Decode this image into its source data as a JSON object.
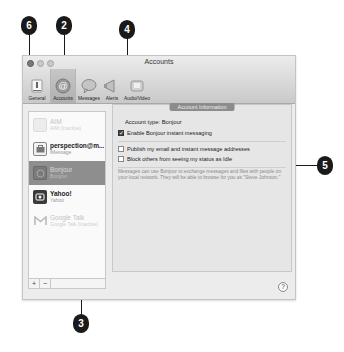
{
  "window": {
    "title": "Accounts",
    "toolbar": [
      {
        "label": "General",
        "icon": "general-switch-icon",
        "selected": false
      },
      {
        "label": "Accounts",
        "icon": "at-sign-icon",
        "selected": true
      },
      {
        "label": "Messages",
        "icon": "speech-bubble-icon",
        "selected": false
      },
      {
        "label": "Alerts",
        "icon": "megaphone-icon",
        "selected": false
      },
      {
        "label": "Audio/Video",
        "icon": "video-camera-icon",
        "selected": false
      }
    ]
  },
  "sidebar": {
    "accounts": [
      {
        "name": "AIM",
        "sub": "AIM (Inactive)",
        "icon": "aim-icon",
        "state": "dim"
      },
      {
        "name": "perspection@m...",
        "sub": "iMessage",
        "icon": "imessage-icon",
        "state": "normal"
      },
      {
        "name": "Bonjour",
        "sub": "Bonjour",
        "icon": "bonjour-icon",
        "state": "selected"
      },
      {
        "name": "Yahoo!",
        "sub": "Yahoo",
        "icon": "yahoo-icon",
        "state": "normal"
      },
      {
        "name": "Google Talk",
        "sub": "Google Talk (Inactive)",
        "icon": "gmail-icon",
        "state": "dim"
      }
    ],
    "add_label": "+",
    "remove_label": "−"
  },
  "panel": {
    "tab_label": "Account Information",
    "account_type_label": "Account type:",
    "account_type_value": "Bonjour",
    "enable_label": "Enable Bonjour instant messaging",
    "enable_checked": true,
    "publish_label": "Publish my email and instant message addresses",
    "publish_checked": false,
    "block_label": "Block others from seeing my status as Idle",
    "block_checked": false,
    "description": "Messages can use Bonjour to exchange messages and files with people on your local network. They will be able to browse for you as \"Steve Johnson.\"",
    "help_label": "?"
  },
  "callouts": [
    {
      "number": "6"
    },
    {
      "number": "2"
    },
    {
      "number": "4"
    },
    {
      "number": "5"
    },
    {
      "number": "3"
    }
  ]
}
